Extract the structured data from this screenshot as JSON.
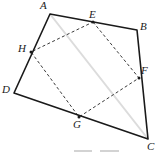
{
  "figure": {
    "canvas": {
      "width": 163,
      "height": 157
    },
    "colors": {
      "outline": "#1a1a1a",
      "dashed": "#3a3a3a",
      "diagonal": "#dcdcdc",
      "marks": "#cfcfcf",
      "label": "#1a1a1a"
    },
    "stroke_widths": {
      "outline": 1.6,
      "dashed": 1.0,
      "diagonal": 2.0,
      "marks": 1.8
    },
    "dash_pattern": "3,2.4",
    "vertices": [
      {
        "id": "A",
        "label": "A",
        "x": 50,
        "y": 14,
        "label_x": 40,
        "label_y": 0,
        "dot": false
      },
      {
        "id": "B",
        "label": "B",
        "x": 137,
        "y": 30,
        "label_x": 140,
        "label_y": 21,
        "dot": false
      },
      {
        "id": "C",
        "label": "C",
        "x": 148,
        "y": 139,
        "label_x": 147,
        "label_y": 141,
        "dot": false
      },
      {
        "id": "D",
        "label": "D",
        "x": 14,
        "y": 93,
        "label_x": 2,
        "label_y": 84,
        "dot": false
      },
      {
        "id": "E",
        "label": "E",
        "x": 93,
        "y": 22,
        "label_x": 89,
        "label_y": 9,
        "dot": true
      },
      {
        "id": "F",
        "label": "F",
        "x": 139,
        "y": 78,
        "label_x": 141,
        "label_y": 65,
        "dot": true
      },
      {
        "id": "G",
        "label": "G",
        "x": 79,
        "y": 117,
        "label_x": 73,
        "label_y": 119,
        "dot": true
      },
      {
        "id": "H",
        "label": "H",
        "x": 31,
        "y": 52,
        "label_x": 18,
        "label_y": 43,
        "dot": true
      }
    ],
    "outline_polygon": "50,14 137,30 148,139 14,93",
    "dashed_polygon": "93,22 139,78 79,117 31,52",
    "diagonal_segment": {
      "from": "A",
      "to": "C",
      "x1": 50,
      "y1": 14,
      "x2": 148,
      "y2": 139
    },
    "bottom_marks": [
      {
        "x1": 74,
        "y1": 151,
        "x2": 92,
        "y2": 151
      },
      {
        "x1": 100,
        "y1": 151,
        "x2": 119,
        "y2": 151
      }
    ],
    "segment_names": {
      "ab": "A-B",
      "bc": "B-C",
      "cd": "C-D",
      "da": "D-A",
      "ef": "E-F",
      "fg": "F-G",
      "gh": "G-H",
      "he": "H-E",
      "ac": "A-C"
    }
  }
}
